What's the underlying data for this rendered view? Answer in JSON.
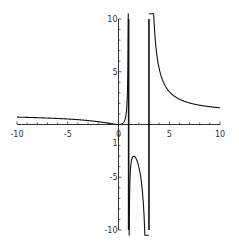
{
  "chart_data": {
    "type": "line",
    "title": "",
    "xlabel": "",
    "ylabel": "",
    "xlim": [
      -10,
      10
    ],
    "ylim": [
      -10,
      10
    ],
    "grid": false,
    "legend": null,
    "x_ticks": [
      "-10",
      "-5",
      "0",
      "5",
      "10"
    ],
    "y_ticks": [
      "10",
      "5",
      "-5",
      "-10"
    ],
    "y_tick_label_near_origin": "1",
    "function": "x^2/((x-1)(x-3))",
    "vertical_asymptotes": [
      1,
      3
    ],
    "series": [
      {
        "name": "branch-left",
        "x": [
          -10,
          -8,
          -6,
          -4,
          -2,
          -1,
          0,
          0.5,
          0.8,
          0.95
        ],
        "y": [
          0.7,
          0.65,
          0.57,
          0.46,
          0.27,
          0.13,
          0,
          0.2,
          1.45,
          8.6
        ]
      },
      {
        "name": "branch-middle",
        "x": [
          1.05,
          1.2,
          1.5,
          1.8,
          2.2,
          2.6,
          2.9
        ],
        "y": [
          -11.6,
          -4.4,
          -3.0,
          -3.4,
          -5.4,
          -11.5,
          -80
        ]
      },
      {
        "name": "branch-right",
        "x": [
          3.1,
          3.5,
          4,
          5,
          6,
          7,
          8,
          9,
          10
        ],
        "y": [
          45.7,
          9.8,
          5.33,
          3.13,
          2.4,
          2.04,
          1.83,
          1.69,
          1.59
        ]
      }
    ]
  },
  "axes": {
    "x_labels": [
      "-10",
      "-5",
      "0",
      "5",
      "10"
    ],
    "y_labels": [
      "10",
      "5",
      "-5",
      "-10"
    ],
    "y_small_label": "1"
  },
  "colors": {
    "curve": "#111111",
    "axis": "#333333",
    "background": "#ffffff"
  }
}
